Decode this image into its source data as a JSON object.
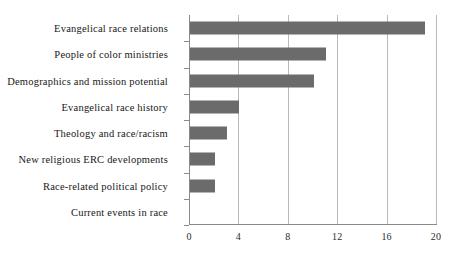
{
  "chart_data": {
    "type": "bar",
    "orientation": "horizontal",
    "title": "",
    "subtitle": "",
    "xlabel": "",
    "ylabel": "",
    "categories": [
      "Evangelical race relations",
      "People of color ministries",
      "Demographics and mission potential",
      "Evangelical race history",
      "Theology and race/racism",
      "New religious ERC developments",
      "Race-related political policy",
      "Current events in race"
    ],
    "values": [
      19,
      11,
      10,
      4,
      3,
      2,
      2,
      0
    ],
    "xlim": [
      0,
      20
    ],
    "xticks": [
      0,
      4,
      8,
      12,
      16,
      20
    ],
    "xtick_labels": [
      "0",
      "4",
      "8",
      "12",
      "16",
      "20"
    ],
    "grid": "vertical",
    "legend": "none",
    "bar_color": "#6b6b6b",
    "axis_color": "#8a8a8a",
    "gridline_color": "#b9b9b9",
    "background_color": "#ffffff"
  }
}
